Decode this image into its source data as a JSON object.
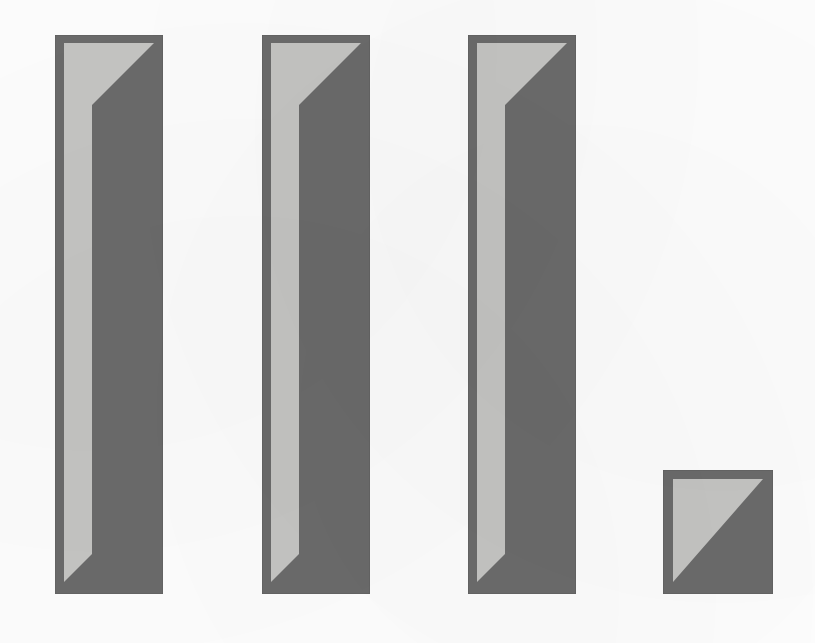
{
  "figure": {
    "kind": "scanned-bar-chart-figure",
    "background_color": "#fefefe",
    "width": 815,
    "height": 643,
    "title": "",
    "subtitle": "",
    "axis_labels_visible": false,
    "tick_labels_visible": false,
    "legend_visible": false,
    "gridlines_visible": false
  },
  "style": {
    "bar_body_color": "#6b6b6b",
    "bar_highlight_color": "#c5c5c3",
    "bar_edge_color": "#5f5f5f",
    "page_color": "#fefefe"
  },
  "chart_data": {
    "type": "bar",
    "title": "",
    "subtitle": "",
    "xlabel": "",
    "ylabel": "",
    "categories": [
      "1",
      "2",
      "3",
      "4"
    ],
    "values": [
      100,
      100,
      100,
      22
    ],
    "value_unit": "relative bar height (% of tallest)",
    "ylim": [
      0,
      100
    ],
    "grid": false,
    "legend": "none",
    "series": [
      {
        "name": "series-1",
        "values": [
          100,
          100,
          100,
          22
        ]
      }
    ],
    "annotations": []
  },
  "bars": [
    {
      "id": "bar-1",
      "label": "1",
      "left": 55,
      "top": 35,
      "width": 108,
      "height": 559,
      "value": 100
    },
    {
      "id": "bar-2",
      "label": "2",
      "left": 262,
      "top": 35,
      "width": 108,
      "height": 559,
      "value": 100
    },
    {
      "id": "bar-3",
      "label": "3",
      "left": 468,
      "top": 35,
      "width": 108,
      "height": 559,
      "value": 100
    },
    {
      "id": "bar-4",
      "label": "4",
      "left": 663,
      "top": 470,
      "width": 110,
      "height": 124,
      "value": 22
    }
  ]
}
